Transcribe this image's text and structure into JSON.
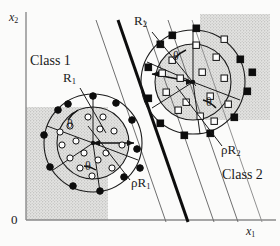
{
  "figure": {
    "type": "scatter",
    "background_color": "#fbfbfa",
    "shade_color": "#d9d9d9",
    "stipple_color": "#bdbdbd",
    "ink_color": "#141414"
  },
  "axes": {
    "x_label": "x",
    "x_label_sub": "1",
    "y_label": "x",
    "y_label_sub": "2",
    "origin_label": "0",
    "x_axis_y": 220,
    "y_axis_x": 26,
    "axis_color": "#8a8a8a"
  },
  "labels": {
    "class1": "Class 1",
    "class2": "Class 2",
    "R1": "R",
    "R1_sub": "1",
    "R2": "R",
    "R2_sub": "2",
    "rhoR1_rho": "ρ",
    "rhoR1": "R",
    "rhoR1_sub": "1",
    "rhoR2_rho": "ρ",
    "rhoR2": "R",
    "rhoR2_sub": "2",
    "theta": "θ"
  },
  "clusters": [
    {
      "name": "class-1-cluster",
      "center": [
        93,
        143
      ],
      "inner_radius": 36,
      "outer_radius": 49,
      "marker": "circle",
      "inner_marker_fill": "open",
      "outer_marker_fill": "solid",
      "theta_labels": [
        {
          "text": "θ",
          "x": 74,
          "y": 126
        },
        {
          "text": "θ",
          "x": 91,
          "y": 165
        }
      ],
      "inner_points": [
        [
          70,
          126
        ],
        [
          88,
          118
        ],
        [
          76,
          141
        ],
        [
          96,
          131
        ],
        [
          112,
          130
        ],
        [
          84,
          152
        ],
        [
          104,
          152
        ],
        [
          70,
          157
        ],
        [
          90,
          175
        ],
        [
          112,
          168
        ],
        [
          122,
          144
        ],
        [
          102,
          118
        ],
        [
          64,
          144
        ],
        [
          114,
          112
        ],
        [
          80,
          168
        ]
      ],
      "outer_points": [
        [
          93,
          96
        ],
        [
          68,
          104
        ],
        [
          116,
          103
        ],
        [
          132,
          120
        ],
        [
          135,
          148
        ],
        [
          124,
          177
        ],
        [
          99,
          190
        ],
        [
          72,
          186
        ],
        [
          50,
          166
        ],
        [
          45,
          134
        ],
        [
          58,
          110
        ],
        [
          137,
          165
        ]
      ]
    },
    {
      "name": "class-2-cluster",
      "center": [
        193,
        82
      ],
      "inner_radius": 38,
      "outer_radius": 52,
      "marker": "square",
      "inner_marker_fill": "open",
      "outer_marker_fill": "solid",
      "theta_labels": [
        {
          "text": "θ",
          "x": 180,
          "y": 58
        },
        {
          "text": "θ",
          "x": 212,
          "y": 104
        }
      ],
      "inner_points": [
        [
          172,
          60
        ],
        [
          196,
          45
        ],
        [
          216,
          57
        ],
        [
          180,
          78
        ],
        [
          202,
          72
        ],
        [
          224,
          78
        ],
        [
          166,
          92
        ],
        [
          186,
          102
        ],
        [
          210,
          96
        ],
        [
          178,
          110
        ],
        [
          200,
          118
        ],
        [
          226,
          104
        ],
        [
          160,
          72
        ],
        [
          236,
          92
        ],
        [
          192,
          86
        ]
      ],
      "outer_points": [
        [
          172,
          36
        ],
        [
          196,
          28
        ],
        [
          224,
          36
        ],
        [
          240,
          60
        ],
        [
          245,
          90
        ],
        [
          234,
          116
        ],
        [
          210,
          132
        ],
        [
          184,
          134
        ],
        [
          160,
          122
        ],
        [
          148,
          98
        ],
        [
          148,
          66
        ],
        [
          160,
          44
        ],
        [
          252,
          72
        ]
      ]
    }
  ],
  "radii_lines": [
    {
      "name": "R1-leader",
      "from": [
        80,
        86
      ],
      "to": [
        103,
        128
      ]
    },
    {
      "name": "R2-leader",
      "from": [
        152,
        30
      ],
      "to": [
        196,
        85
      ]
    },
    {
      "name": "rhoR1-leader",
      "from": [
        128,
        182
      ],
      "to": [
        85,
        128
      ]
    },
    {
      "name": "rhoR2-leader",
      "from": [
        220,
        148
      ],
      "to": [
        178,
        88
      ]
    }
  ],
  "decision_boundaries": [
    {
      "name": "boundary-thick",
      "x1": 118,
      "y1": 22,
      "x2": 188,
      "y2": 222,
      "width": 3.0,
      "color": "#0d0d0d"
    },
    {
      "name": "boundary-thin-1",
      "x1": 96,
      "y1": 22,
      "x2": 166,
      "y2": 222,
      "width": 1.0,
      "color": "#6b6b6b"
    },
    {
      "name": "boundary-thin-2",
      "x1": 144,
      "y1": 22,
      "x2": 214,
      "y2": 222,
      "width": 1.0,
      "color": "#6b6b6b"
    },
    {
      "name": "boundary-thin-3",
      "x1": 168,
      "y1": 22,
      "x2": 238,
      "y2": 222,
      "width": 1.0,
      "color": "#6b6b6b"
    },
    {
      "name": "boundary-thin-4",
      "x1": 190,
      "y1": 22,
      "x2": 260,
      "y2": 222,
      "width": 1.0,
      "color": "#8f8f8f"
    }
  ],
  "shaded_regions": [
    {
      "name": "left-shade",
      "x": 26,
      "y": 107,
      "width": 82,
      "height": 113
    },
    {
      "name": "right-shade",
      "x": 200,
      "y": 14,
      "width": 70,
      "height": 106
    }
  ]
}
